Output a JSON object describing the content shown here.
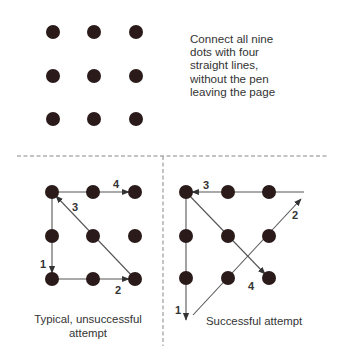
{
  "puzzle": {
    "instruction_lines": [
      "Connect all nine",
      "dots with four",
      "straight lines,",
      "without the pen",
      "leaving the page"
    ],
    "dot_color": "#2b1a1a",
    "line_color": "#555555"
  },
  "typical_attempt": {
    "caption_lines": [
      "Typical, unsuccessful",
      "attempt"
    ],
    "step_labels": [
      "1",
      "2",
      "3",
      "4"
    ]
  },
  "successful_attempt": {
    "caption": "Successful attempt",
    "step_labels": [
      "1",
      "2",
      "3",
      "4"
    ]
  }
}
